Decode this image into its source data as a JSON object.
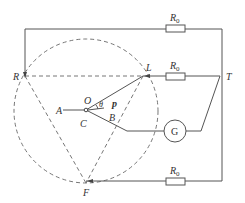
{
  "labels": {
    "R": "R",
    "L": "L",
    "T": "T",
    "F": "F",
    "A": "A",
    "O": "O",
    "C": "C",
    "B": "B",
    "p": "p",
    "theta": "θ",
    "G": "G",
    "R0": "R",
    "R0_sub": "0"
  },
  "resistors": [
    {
      "name": "top",
      "label": "R",
      "sub": "0"
    },
    {
      "name": "middle",
      "label": "R",
      "sub": "0"
    },
    {
      "name": "bottom",
      "label": "R",
      "sub": "0"
    }
  ]
}
